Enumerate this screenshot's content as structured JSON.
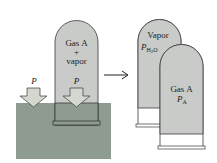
{
  "diagram": {
    "left_tube": {
      "line1": "Gas A",
      "line2": "+",
      "line3": "vapor",
      "inner_pressure_label": "P"
    },
    "outside_pressure_label": "P",
    "transition_arrow": "right-arrow",
    "right_back_tube": {
      "line1": "Vapor",
      "pressure_symbol": "P",
      "pressure_subscript": "H",
      "pressure_subscript_2": "2",
      "pressure_subscript_3": "O"
    },
    "right_front_tube": {
      "line1": "Gas A",
      "pressure_symbol": "P",
      "pressure_subscript": "A"
    },
    "colors": {
      "gas_fill": "#c9cbc9",
      "water": "#8e9b90",
      "arrow_fill": "#d4d6d0",
      "outline": "#3a3a3a"
    }
  }
}
